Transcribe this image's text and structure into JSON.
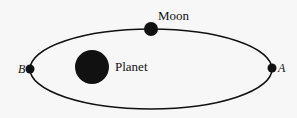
{
  "diagram": {
    "orbit": {
      "cx": 151,
      "cy": 69,
      "rx": 121,
      "ry": 40,
      "stroke": "#111111",
      "stroke_width": 1.6
    },
    "moon": {
      "label": "Moon",
      "cx": 151,
      "cy": 29,
      "r": 7,
      "label_x": 158,
      "label_y": 20
    },
    "planet": {
      "label": "Planet",
      "cx": 92,
      "cy": 67,
      "r": 17,
      "label_x": 115,
      "label_y": 71
    },
    "point_a": {
      "label": "A",
      "cx": 272,
      "cy": 68,
      "r": 4.5,
      "label_x": 278,
      "label_y": 72
    },
    "point_b": {
      "label": "B",
      "cx": 30,
      "cy": 69,
      "r": 4.5,
      "label_x": 18,
      "label_y": 73
    },
    "colors": {
      "background": "#f7f7f7",
      "ink": "#111111"
    }
  }
}
